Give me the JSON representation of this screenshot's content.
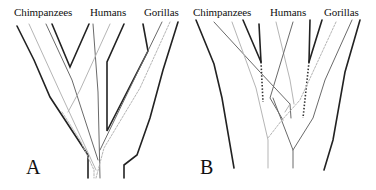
{
  "figure": {
    "panels": [
      {
        "id": "A",
        "letter": "A",
        "taxa": [
          "Chimpanzees",
          "Humans",
          "Gorillas"
        ]
      },
      {
        "id": "B",
        "letter": "B",
        "taxa": [
          "Chimpanzees",
          "Humans",
          "Gorillas"
        ]
      }
    ]
  },
  "colors": {
    "species_tree": "#222222",
    "gene_lineage_mid": "#6a6a6a",
    "gene_lineage_light": "#b5b5b5",
    "dotted": "#333333",
    "background": "#ffffff"
  }
}
